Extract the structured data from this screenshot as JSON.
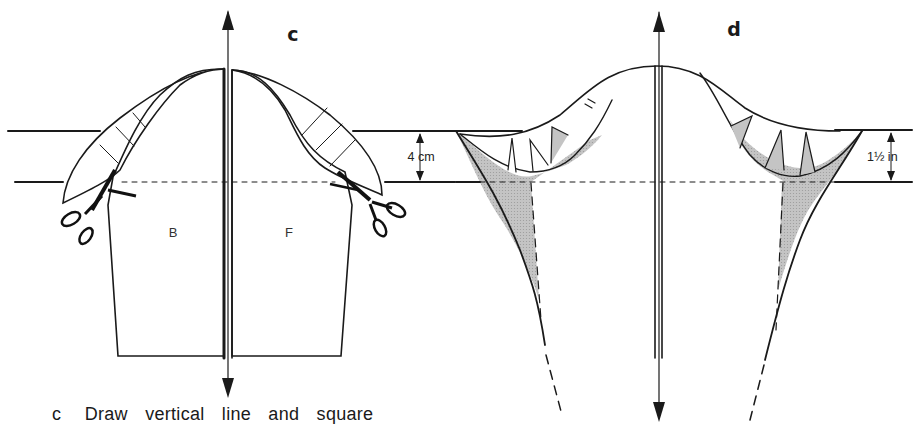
{
  "figure": {
    "panels": [
      {
        "id": "c",
        "letter": "c",
        "pieces": [
          {
            "label": "B",
            "meaning": "back"
          },
          {
            "label": "F",
            "meaning": "front"
          }
        ],
        "dimension_label": "4 cm",
        "features": [
          "vertical grain arrow",
          "sleeve cap split at center",
          "cap extensions hatched",
          "scissors cutting underarm",
          "dashed biceps line"
        ]
      },
      {
        "id": "d",
        "letter": "d",
        "dimension_label": "1½ in",
        "features": [
          "vertical grain arrow",
          "spread cap with darts",
          "shaded added areas",
          "dashed underarm lines extended"
        ]
      }
    ],
    "caption": {
      "letter": "c",
      "text": "Draw vertical line and square"
    },
    "colors": {
      "line": "#1a1a1a",
      "shade": "#b8b8b8",
      "background": "#ffffff"
    }
  }
}
